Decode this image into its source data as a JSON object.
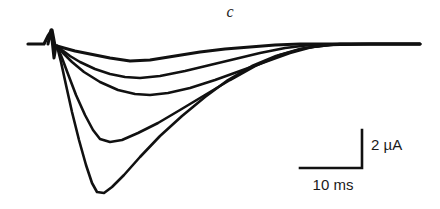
{
  "figure": {
    "panel_label": "c",
    "kind": "electrophysiology-current-traces",
    "ink_color": "#111111",
    "background_color": "#ffffff"
  },
  "scale_bar": {
    "current_label": "2 µA",
    "time_label": "10 ms",
    "current_value": 2,
    "current_units": "µA",
    "time_value": 10,
    "time_units": "ms",
    "corner_x": 362,
    "corner_y": 168,
    "vertical_top_y": 130,
    "horizontal_left_x": 300
  },
  "chart_data": {
    "type": "line",
    "title": "c",
    "xlabel": "Time",
    "ylabel": "Current",
    "xunits": "ms",
    "yunits": "µA",
    "grid": false,
    "legend": "none",
    "axes_style": "scale-bars-only",
    "baseline_current": 0,
    "px_per_ms": 6.3,
    "px_per_uA": 19.0,
    "stimulus_artifact": {
      "x_px": 52,
      "peak_up_y_px": 30,
      "peak_down_y_px": 58,
      "time_ms": 0
    },
    "series": [
      {
        "name": "trace-1",
        "peak_amplitude_uA": -1.0,
        "peak_time_ms": 11.6,
        "points_px": [
          [
            28,
            44
          ],
          [
            44,
            44
          ],
          [
            48,
            36
          ],
          [
            52,
            30
          ],
          [
            55,
            46
          ],
          [
            57,
            46
          ],
          [
            64,
            48
          ],
          [
            75,
            51
          ],
          [
            90,
            54
          ],
          [
            110,
            58
          ],
          [
            130,
            61
          ],
          [
            150,
            60
          ],
          [
            175,
            56
          ],
          [
            200,
            52
          ],
          [
            225,
            49
          ],
          [
            250,
            47
          ],
          [
            275,
            45
          ],
          [
            300,
            44
          ],
          [
            330,
            44
          ],
          [
            370,
            44
          ],
          [
            420,
            44
          ]
        ]
      },
      {
        "name": "trace-2",
        "peak_amplitude_uA": -1.8,
        "peak_time_ms": 10.8,
        "points_px": [
          [
            57,
            46
          ],
          [
            62,
            50
          ],
          [
            70,
            56
          ],
          [
            80,
            62
          ],
          [
            95,
            69
          ],
          [
            110,
            74
          ],
          [
            125,
            77
          ],
          [
            140,
            78
          ],
          [
            160,
            76
          ],
          [
            185,
            71
          ],
          [
            210,
            65
          ],
          [
            235,
            59
          ],
          [
            260,
            53
          ],
          [
            285,
            48
          ],
          [
            310,
            45
          ],
          [
            340,
            44
          ],
          [
            380,
            44
          ],
          [
            420,
            44
          ]
        ]
      },
      {
        "name": "trace-3",
        "peak_amplitude_uA": -2.7,
        "peak_time_ms": 13.2,
        "points_px": [
          [
            57,
            46
          ],
          [
            63,
            53
          ],
          [
            72,
            62
          ],
          [
            84,
            72
          ],
          [
            100,
            82
          ],
          [
            118,
            90
          ],
          [
            135,
            94
          ],
          [
            150,
            95
          ],
          [
            168,
            93
          ],
          [
            190,
            88
          ],
          [
            215,
            80
          ],
          [
            240,
            71
          ],
          [
            265,
            62
          ],
          [
            290,
            53
          ],
          [
            312,
            47
          ],
          [
            340,
            44
          ],
          [
            380,
            44
          ],
          [
            420,
            44
          ]
        ]
      },
      {
        "name": "trace-4",
        "peak_amplitude_uA": -5.1,
        "peak_time_ms": 6.8,
        "points_px": [
          [
            57,
            46
          ],
          [
            62,
            58
          ],
          [
            68,
            74
          ],
          [
            76,
            95
          ],
          [
            85,
            115
          ],
          [
            93,
            130
          ],
          [
            100,
            139
          ],
          [
            110,
            142
          ],
          [
            122,
            140
          ],
          [
            138,
            133
          ],
          [
            158,
            123
          ],
          [
            180,
            110
          ],
          [
            205,
            95
          ],
          [
            230,
            80
          ],
          [
            255,
            66
          ],
          [
            280,
            55
          ],
          [
            305,
            48
          ],
          [
            330,
            45
          ],
          [
            370,
            44
          ],
          [
            420,
            44
          ]
        ]
      },
      {
        "name": "trace-5",
        "peak_amplitude_uA": -7.9,
        "peak_time_ms": 5.9,
        "points_px": [
          [
            57,
            46
          ],
          [
            61,
            62
          ],
          [
            66,
            85
          ],
          [
            72,
            112
          ],
          [
            79,
            140
          ],
          [
            86,
            165
          ],
          [
            92,
            183
          ],
          [
            97,
            192
          ],
          [
            104,
            193
          ],
          [
            112,
            187
          ],
          [
            124,
            175
          ],
          [
            140,
            157
          ],
          [
            160,
            136
          ],
          [
            182,
            116
          ],
          [
            205,
            97
          ],
          [
            228,
            80
          ],
          [
            252,
            66
          ],
          [
            276,
            56
          ],
          [
            300,
            49
          ],
          [
            325,
            45
          ],
          [
            360,
            44
          ],
          [
            420,
            44
          ]
        ]
      }
    ]
  }
}
